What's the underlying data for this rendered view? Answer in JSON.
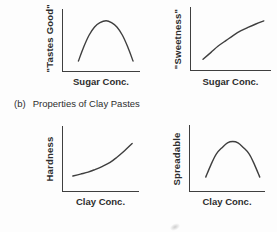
{
  "figure_caption": {
    "prefix": "(b)",
    "text": "Properties of Clay Pastes"
  },
  "colors": {
    "line": "#3f3f3f",
    "text": "#2d2d2d",
    "background": "#fdfdfd"
  },
  "chart_data": [
    {
      "type": "line",
      "title": "",
      "ylabel": "\"Tastes Good\"",
      "xlabel": "Sugar Conc.",
      "shape": "inverted-parabola (peak at mid sugar concentration)",
      "axis_units": "qualitative, no numeric ticks",
      "x": [
        20,
        27,
        34,
        41,
        48,
        56,
        63,
        70,
        77,
        84,
        91
      ],
      "y": [
        16,
        39,
        58,
        71,
        78,
        81,
        78,
        71,
        58,
        39,
        16
      ],
      "xlim": [
        0,
        100
      ],
      "ylim": [
        0,
        100
      ],
      "grid": false,
      "legend": "none"
    },
    {
      "type": "line",
      "title": "",
      "ylabel": "\"Sweetness\"",
      "xlabel": "Sugar Conc.",
      "shape": "monotonically rising, saturating (concave down)",
      "axis_units": "qualitative, no numeric ticks",
      "x": [
        15,
        25,
        34,
        44,
        53,
        62,
        72,
        81,
        91
      ],
      "y": [
        17,
        28,
        38,
        47,
        55,
        62,
        68,
        73,
        78
      ],
      "xlim": [
        0,
        100
      ],
      "ylim": [
        0,
        100
      ],
      "grid": false,
      "legend": "none"
    },
    {
      "type": "line",
      "title": "",
      "ylabel": "Hardness",
      "xlabel": "Clay Conc.",
      "shape": "monotonically rising, accelerating (convex)",
      "axis_units": "qualitative, no numeric ticks",
      "x": [
        13,
        23,
        33,
        42,
        52,
        62,
        71,
        81,
        91
      ],
      "y": [
        23,
        26,
        29,
        33,
        38,
        44,
        52,
        62,
        73
      ],
      "xlim": [
        0,
        100
      ],
      "ylim": [
        0,
        100
      ],
      "grid": false,
      "legend": "none"
    },
    {
      "type": "line",
      "title": "",
      "ylabel": "Spreadable",
      "xlabel": "Clay Conc.",
      "shape": "inverted-parabola (peak at mid clay concentration)",
      "axis_units": "qualitative, no numeric ticks",
      "x": [
        21,
        28,
        35,
        43,
        50,
        57,
        64,
        71,
        79,
        86,
        93
      ],
      "y": [
        21,
        40,
        56,
        66,
        73,
        75,
        73,
        66,
        56,
        40,
        21
      ],
      "xlim": [
        0,
        100
      ],
      "ylim": [
        0,
        100
      ],
      "grid": false,
      "legend": "none"
    }
  ]
}
